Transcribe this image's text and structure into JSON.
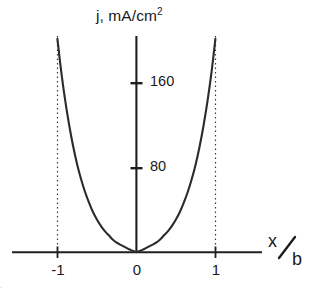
{
  "chart_data": {
    "type": "line",
    "title": "j, mA/cm2",
    "title_main": "j, mA/cm",
    "title_superscript": "2",
    "xlabel_numerator": "x",
    "xlabel_denominator": "b",
    "xlabel": "x/b",
    "ylabel": "j, mA/cm^2",
    "xlim": [
      -1.28,
      1.28
    ],
    "ylim": [
      0,
      205
    ],
    "x_ticks": [
      -1,
      0,
      1
    ],
    "x_tick_labels": [
      "-1",
      "0",
      "1"
    ],
    "y_ticks": [
      80,
      160
    ],
    "y_tick_labels": [
      "80",
      "160"
    ],
    "grid": false,
    "legend": null,
    "reference_lines": [
      {
        "type": "vertical",
        "x": -1,
        "style": "dotted"
      },
      {
        "type": "vertical",
        "x": 1,
        "style": "dotted"
      }
    ],
    "series": [
      {
        "name": "j(x/b)",
        "style": "solid",
        "color": "#2b2b2b",
        "x": [
          -1.0,
          -0.95,
          -0.9,
          -0.85,
          -0.8,
          -0.75,
          -0.7,
          -0.65,
          -0.6,
          -0.55,
          -0.5,
          -0.45,
          -0.4,
          -0.35,
          -0.3,
          -0.25,
          -0.2,
          -0.15,
          -0.1,
          -0.05,
          0.0,
          0.05,
          0.1,
          0.15,
          0.2,
          0.25,
          0.3,
          0.35,
          0.4,
          0.45,
          0.5,
          0.55,
          0.6,
          0.65,
          0.7,
          0.75,
          0.8,
          0.85,
          0.9,
          0.95,
          1.0
        ],
        "values": [
          202,
          170,
          143,
          120,
          100,
          83,
          69,
          57,
          47,
          38,
          31,
          25,
          20,
          16,
          12,
          9,
          7,
          5,
          3,
          1.5,
          0,
          1.5,
          3,
          5,
          7,
          9,
          12,
          16,
          20,
          25,
          31,
          38,
          47,
          57,
          69,
          83,
          100,
          120,
          143,
          170,
          202
        ]
      }
    ],
    "annotations": []
  },
  "colors": {
    "curve": "#2b2b2b",
    "axis": "#1f1f1f",
    "dotted": "#3a3a3a",
    "text": "#1a1a1a",
    "background": "#ffffff"
  },
  "caption_fragment": "."
}
